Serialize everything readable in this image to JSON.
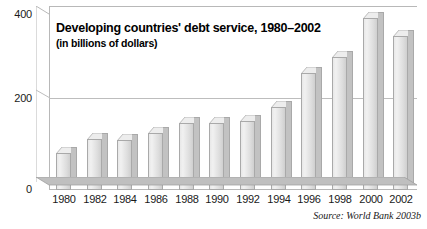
{
  "chart_data": {
    "type": "bar",
    "title": "Developing countries' debt service, 1980–2002",
    "subtitle": "(in billions of dollars)",
    "xlabel": "",
    "ylabel": "",
    "ylim": [
      0,
      400
    ],
    "yticks": [
      0,
      200,
      400
    ],
    "ytick_labels": [
      "0",
      "200",
      "400"
    ],
    "grid": true,
    "legend": false,
    "categories": [
      "1980",
      "1982",
      "1984",
      "1986",
      "1988",
      "1990",
      "1992",
      "1994",
      "1996",
      "1998",
      "2000",
      "2002"
    ],
    "values": [
      85,
      115,
      113,
      130,
      152,
      153,
      157,
      188,
      265,
      303,
      390,
      350
    ],
    "source": "Source: World Bank 2003b"
  },
  "style": {
    "bar_fill": "#e8e8e8",
    "bar_side": "#c2c2c2",
    "bar_outline": "#a9a9a9",
    "floor": "#bfbfbf",
    "gridline": "#bdbdbd",
    "text": "#1a1a1a"
  }
}
